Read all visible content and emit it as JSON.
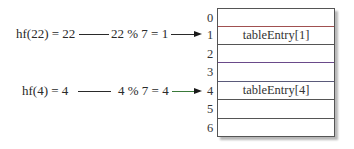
{
  "mappings": [
    {
      "hash_expr": "hf(22) = 22",
      "mod_expr": "22 % 7 = 1",
      "target_index": 1
    },
    {
      "hash_expr": "hf(4) = 4",
      "mod_expr": "4 % 7 = 4",
      "target_index": 4
    }
  ],
  "table": {
    "indices": [
      "0",
      "1",
      "2",
      "3",
      "4",
      "5",
      "6"
    ],
    "entries": [
      "",
      "tableEntry[1]",
      "",
      "",
      "tableEntry[4]",
      "",
      ""
    ]
  }
}
